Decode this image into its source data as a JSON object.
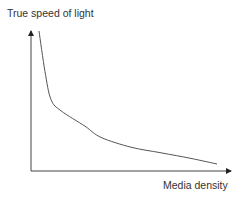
{
  "chart_data": {
    "type": "line",
    "title": "",
    "xlabel": "Media density",
    "ylabel": "True speed of light",
    "axis_ticks": false,
    "grid": false,
    "legend": null,
    "series": [
      {
        "name": "True speed of light vs media density",
        "description": "Monotonically decreasing curve, steep at low density and flattening toward high density (inverse-like relationship)",
        "x": [
          0.04,
          0.07,
          0.1,
          0.15,
          0.27,
          0.35,
          0.5,
          0.65,
          0.8,
          0.93
        ],
        "values": [
          1.0,
          0.71,
          0.51,
          0.43,
          0.32,
          0.24,
          0.17,
          0.13,
          0.09,
          0.05
        ]
      }
    ],
    "xlim": [
      0,
      1
    ],
    "ylim": [
      0,
      1
    ],
    "colors": {
      "axis": "#222222",
      "curve": "#555555",
      "text": "#333333"
    }
  }
}
